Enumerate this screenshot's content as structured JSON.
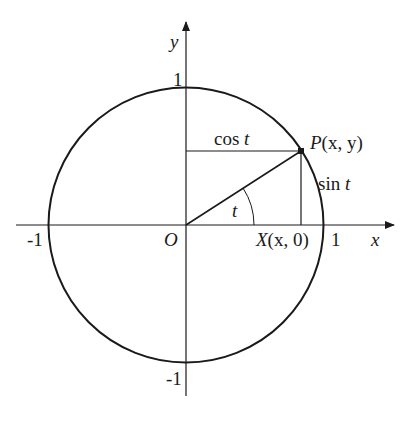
{
  "diagram": {
    "colors": {
      "stroke": "#1a1a1a",
      "background": "#ffffff"
    },
    "geometry": {
      "origin": [
        186,
        225
      ],
      "radius": 138,
      "angle_deg": 33,
      "point_P": [
        301,
        151
      ],
      "point_X": [
        301,
        225
      ],
      "arc_radius": 68
    },
    "labels": {
      "y_axis": "y",
      "x_axis": "x",
      "y_top_tick": "1",
      "y_bottom_tick": "-1",
      "x_left_tick": "-1",
      "x_right_tick": "1",
      "origin": "O",
      "point_P_letter": "P",
      "point_P_coords": "(x, y)",
      "point_X_letter": "X",
      "point_X_coords": "(x, 0)",
      "cos_text": "cos",
      "cos_var": "t",
      "sin_text": "sin",
      "sin_var": "t",
      "angle": "t"
    }
  }
}
